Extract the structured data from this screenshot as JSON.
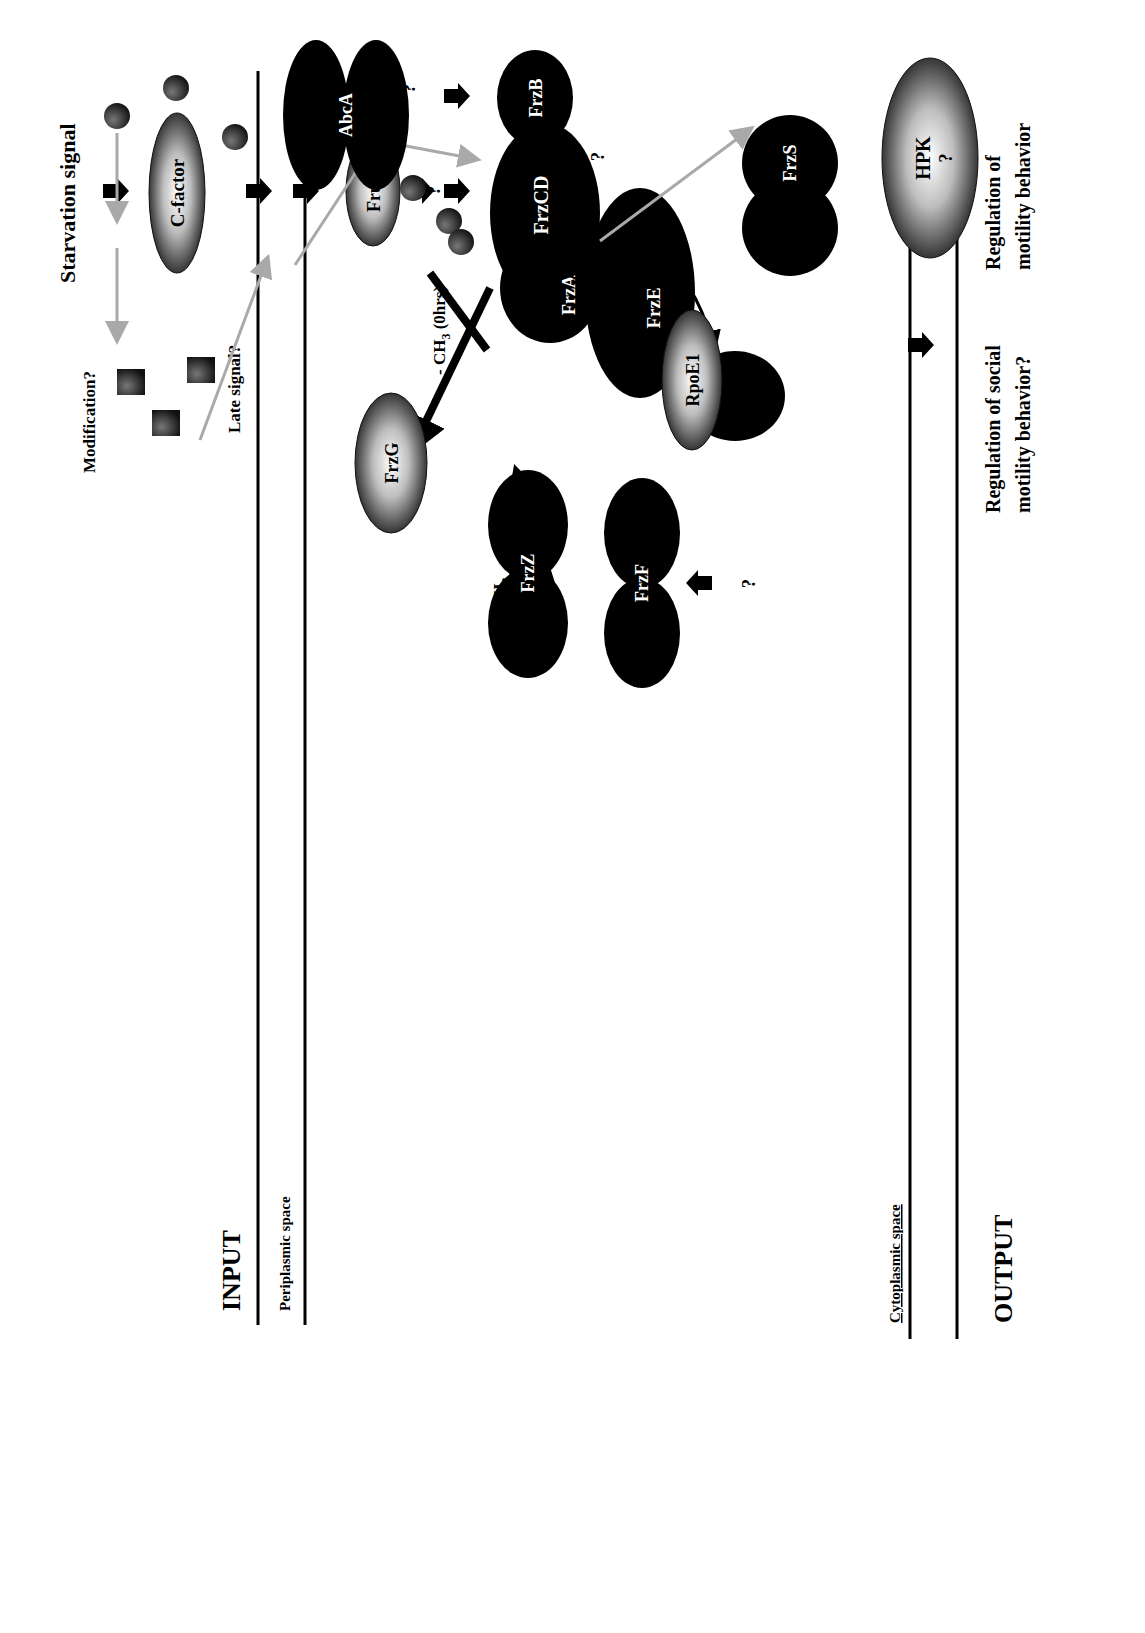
{
  "sections": {
    "input": "INPUT",
    "output": "OUTPUT",
    "periplasmic": "Periplasmic space",
    "cytoplasmic": "Cytoplasmic space"
  },
  "signals": {
    "starvation": "Starvation signal",
    "modification": "Modification?",
    "late_signal": "Late signal?"
  },
  "proteins": {
    "c_factor": "C-factor",
    "frua": "FruA",
    "frzg": "FrzG",
    "frzf": "FrzF",
    "frzcd": "FrzCD",
    "frza": "FrzA",
    "frzb": "FrzB",
    "frze": "FrzE",
    "frzs": "FrzS",
    "abca": "AbcA",
    "frzz": "FrzZ",
    "rpoe1": "RpoE1",
    "hpk": "HPK",
    "hpk_q": "?"
  },
  "annotations": {
    "demethyl": "- CH",
    "demethyl_sub": "3",
    "demethyl_time": " (0hrs)",
    "methyl": "+ CH",
    "methyl_sub": "3",
    "phospho": "P",
    "phospho_hpk": "P",
    "q_frzb": "?",
    "q_frzs": "?",
    "q_frzf": "?",
    "q_abca": "?"
  },
  "outputs": {
    "motility_1": "Regulation of",
    "motility_2": "motility behavior",
    "social_1": "Regulation of social",
    "social_2": "motility behavior?",
    "gene_1": "Regulation of",
    "gene_2": "gene expression"
  },
  "colors": {
    "ink": "#000000",
    "signal_gray": "#a9a9a9",
    "background": "#ffffff"
  }
}
